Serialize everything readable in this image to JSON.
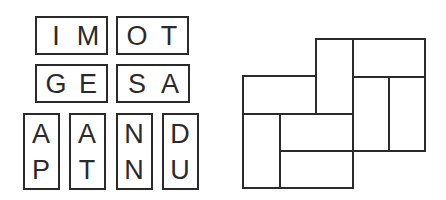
{
  "puzzle": {
    "horizontal_tiles": [
      {
        "letters": [
          "I",
          "M"
        ]
      },
      {
        "letters": [
          "O",
          "T"
        ]
      },
      {
        "letters": [
          "G",
          "E"
        ]
      },
      {
        "letters": [
          "S",
          "A"
        ]
      }
    ],
    "vertical_tiles": [
      {
        "letters": [
          "A",
          "P"
        ]
      },
      {
        "letters": [
          "A",
          "T"
        ]
      },
      {
        "letters": [
          "N",
          "N"
        ]
      },
      {
        "letters": [
          "D",
          "U"
        ]
      }
    ],
    "grid": {
      "description": "Empty shape made of 8 domino slots (4 horizontal, 4 vertical)",
      "slot_count": 8
    }
  }
}
